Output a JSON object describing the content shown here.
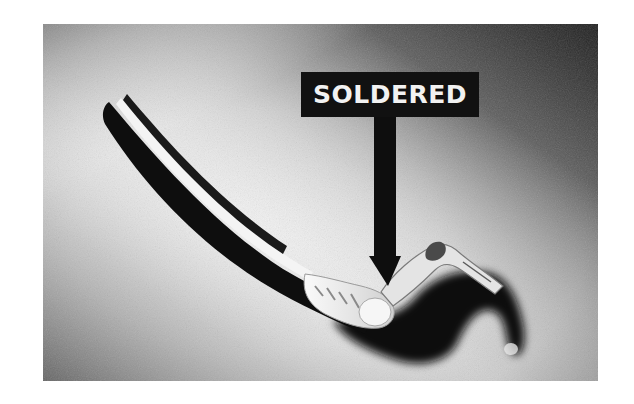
{
  "photo": {
    "description": "Black-and-white photograph of a shielded cable with a soldered connection to a terminal lug",
    "callout": {
      "label": "SOLDERED",
      "label_color": "#f2f2f2",
      "box_color": "#111111"
    },
    "colors": {
      "page_background": "#ffffff",
      "photo_light": "#ececec",
      "photo_dark": "#2a2a2a",
      "cable": "#0e0e0e"
    }
  }
}
